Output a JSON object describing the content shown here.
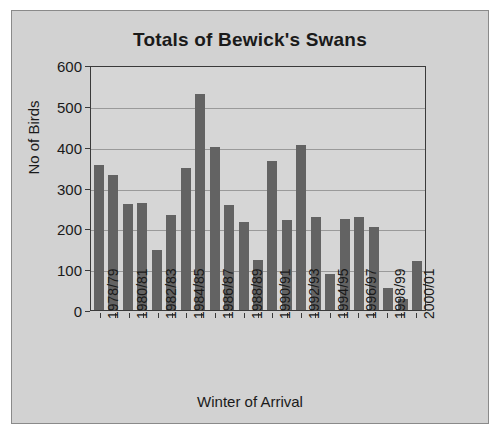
{
  "chart_data": {
    "type": "bar",
    "title": "Totals of Bewick's Swans",
    "xlabel": "Winter of Arrival",
    "ylabel": "No of Birds",
    "ylim": [
      0,
      600
    ],
    "ytick_step": 100,
    "yticks": [
      "600",
      "500",
      "400",
      "300",
      "200",
      "100",
      "0"
    ],
    "grid": "horizontal",
    "legend": "none",
    "bar_color": "#636363",
    "plot_background": "#d6d6d6",
    "figure_background": "#d2d2d2",
    "axis_color": "#3a3a3a",
    "categories": [
      "1978/79",
      "1979/80",
      "1980/81",
      "1981/82",
      "1982/83",
      "1983/84",
      "1984/85",
      "1985/86",
      "1986/87",
      "1987/88",
      "1988/89",
      "1989/90",
      "1990/91",
      "1991/92",
      "1992/93",
      "1993/94",
      "1994/95",
      "1995/96",
      "1996/97",
      "1997/98",
      "1998/99",
      "1999/00",
      "2000/01"
    ],
    "tick_labels_shown": [
      "1978/79",
      "",
      "1980/81",
      "",
      "1982/83",
      "",
      "1984/85",
      "",
      "1986/87",
      "",
      "1988/89",
      "",
      "1990/91",
      "",
      "1992/93",
      "",
      "1994/95",
      "",
      "1996/97",
      "",
      "1998/99",
      "",
      "2000/01"
    ],
    "values": [
      355,
      330,
      260,
      263,
      147,
      233,
      348,
      528,
      400,
      258,
      215,
      122,
      365,
      220,
      405,
      228,
      88,
      222,
      228,
      203,
      55,
      27,
      120
    ]
  }
}
